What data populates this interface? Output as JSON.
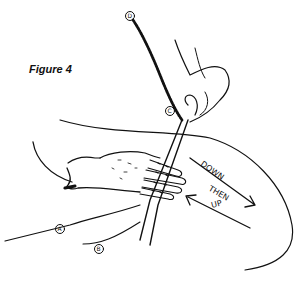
{
  "figure": {
    "caption": "Figure 4",
    "labels": {
      "a": "A",
      "b": "B",
      "c": "C",
      "d": "D"
    },
    "annotation": {
      "line1": "DOWN",
      "line2": "THEN",
      "line3": "UP"
    },
    "colors": {
      "ink": "#111111",
      "background": "#ffffff"
    }
  }
}
